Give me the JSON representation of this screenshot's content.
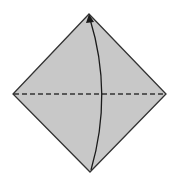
{
  "diagram": {
    "type": "origami-fold-step",
    "paper": {
      "shape": "square-on-point",
      "fill": "#c8c8c8",
      "stroke": "#333333",
      "vertices": {
        "top": [
          89,
          14
        ],
        "right": [
          166,
          94
        ],
        "bottom": [
          90,
          172
        ],
        "left": [
          13,
          94
        ]
      }
    },
    "fold_line": {
      "style": "valley-dashed",
      "from": [
        13,
        94
      ],
      "to": [
        166,
        94
      ],
      "color": "#333333"
    },
    "arrow": {
      "meaning": "fold bottom corner up to top corner",
      "from": [
        91,
        170
      ],
      "control": [
        112,
        94
      ],
      "to": [
        90,
        17
      ],
      "color": "#1a1a1a"
    }
  }
}
